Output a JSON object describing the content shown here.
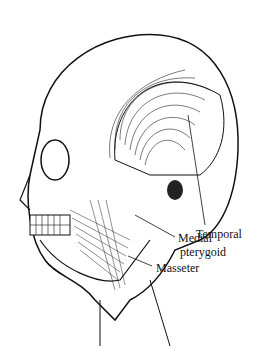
{
  "figure": {
    "labels": [
      {
        "id": "temporal",
        "text": "Temporal"
      },
      {
        "id": "medial_pterygoid_1",
        "text": "Medial"
      },
      {
        "id": "medial_pterygoid_2",
        "text": "pterygoid"
      },
      {
        "id": "masseter",
        "text": "Masseter"
      }
    ]
  }
}
